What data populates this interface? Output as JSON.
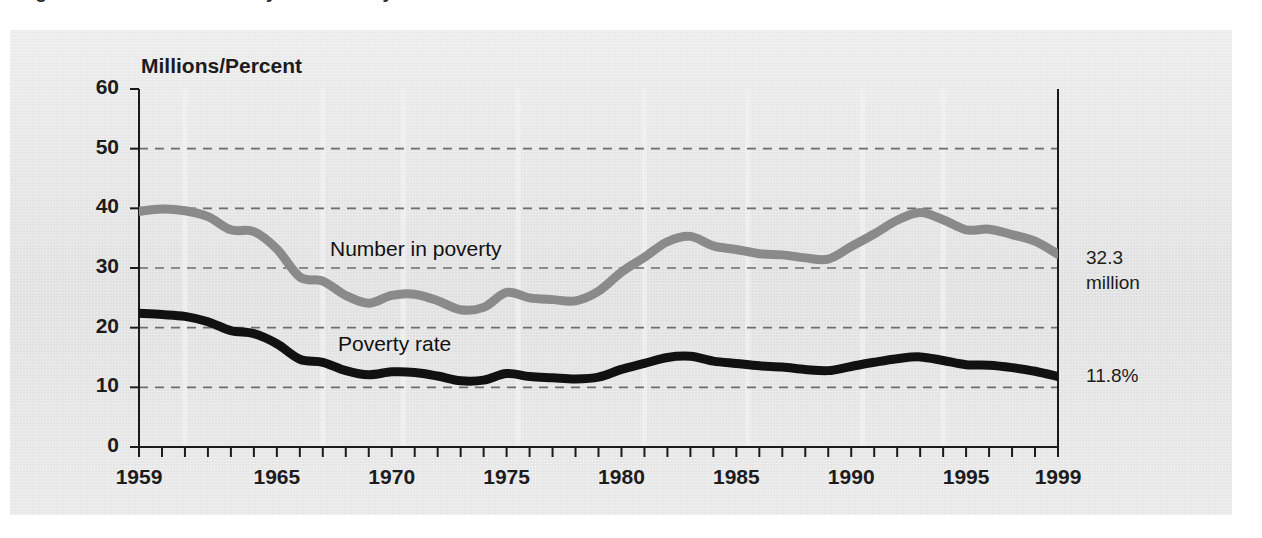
{
  "figure": {
    "title_remnant": "Figure 1. Number in Poverty and Poverty Rate: 1959 to 1999",
    "background_color": "#e4e4e4",
    "page_color": "#ffffff"
  },
  "axis_title": "Millions/Percent",
  "annotations": {
    "number_value": "32.3\nmillion",
    "rate_value": "11.8%"
  },
  "series_labels": {
    "number": "Number in poverty",
    "rate": "Poverty rate"
  },
  "chart_data": {
    "type": "line",
    "title": "Number in Poverty and Poverty Rate: 1959 to 1999",
    "xlabel": "",
    "ylabel": "Millions/Percent",
    "xlim": [
      1959,
      1999
    ],
    "ylim": [
      0,
      60
    ],
    "yticks": [
      0,
      10,
      20,
      30,
      40,
      50,
      60
    ],
    "xticks": [
      1959,
      1960,
      1961,
      1962,
      1963,
      1964,
      1965,
      1966,
      1967,
      1968,
      1969,
      1970,
      1971,
      1972,
      1973,
      1974,
      1975,
      1976,
      1977,
      1978,
      1979,
      1980,
      1981,
      1982,
      1983,
      1984,
      1985,
      1986,
      1987,
      1988,
      1989,
      1990,
      1991,
      1992,
      1993,
      1994,
      1995,
      1996,
      1997,
      1998,
      1999
    ],
    "xtick_labels": [
      "1959",
      "1965",
      "1970",
      "1975",
      "1980",
      "1985",
      "1990",
      "1995",
      "1999"
    ],
    "xtick_label_years": [
      1959,
      1965,
      1970,
      1975,
      1980,
      1985,
      1990,
      1995,
      1999
    ],
    "grid": "horizontal-dashed",
    "gridlines_at": [
      10,
      20,
      30,
      40,
      50
    ],
    "legend": "inline-labels",
    "x": [
      1959,
      1960,
      1961,
      1962,
      1963,
      1964,
      1965,
      1966,
      1967,
      1968,
      1969,
      1970,
      1971,
      1972,
      1973,
      1974,
      1975,
      1976,
      1977,
      1978,
      1979,
      1980,
      1981,
      1982,
      1983,
      1984,
      1985,
      1986,
      1987,
      1988,
      1989,
      1990,
      1991,
      1992,
      1993,
      1994,
      1995,
      1996,
      1997,
      1998,
      1999
    ],
    "series": [
      {
        "name": "Number in poverty",
        "units": "millions",
        "color": "#8a8a8a",
        "end_label": "32.3 million",
        "values": [
          39.5,
          39.9,
          39.6,
          38.6,
          36.4,
          36.1,
          33.2,
          28.5,
          27.8,
          25.4,
          24.1,
          25.4,
          25.6,
          24.5,
          23.0,
          23.4,
          25.9,
          25.0,
          24.7,
          24.5,
          26.1,
          29.3,
          31.8,
          34.4,
          35.3,
          33.7,
          33.1,
          32.4,
          32.2,
          31.7,
          31.5,
          33.6,
          35.7,
          38.0,
          39.3,
          38.1,
          36.4,
          36.5,
          35.6,
          34.5,
          32.3
        ]
      },
      {
        "name": "Poverty rate",
        "units": "percent",
        "color": "#111111",
        "end_label": "11.8%",
        "values": [
          22.4,
          22.2,
          21.9,
          21.0,
          19.5,
          19.0,
          17.3,
          14.7,
          14.2,
          12.8,
          12.1,
          12.6,
          12.5,
          11.9,
          11.1,
          11.2,
          12.3,
          11.8,
          11.6,
          11.4,
          11.7,
          13.0,
          14.0,
          15.0,
          15.2,
          14.4,
          14.0,
          13.6,
          13.4,
          13.0,
          12.8,
          13.5,
          14.2,
          14.8,
          15.1,
          14.5,
          13.8,
          13.7,
          13.3,
          12.7,
          11.8
        ]
      }
    ]
  }
}
